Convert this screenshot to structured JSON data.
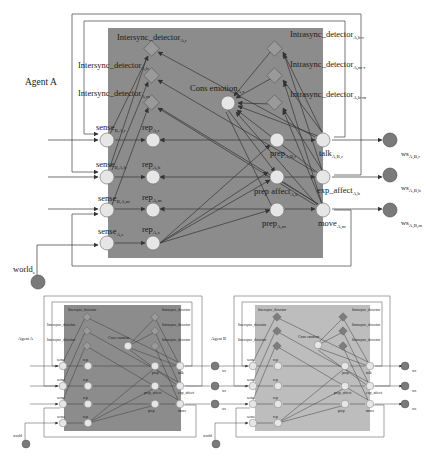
{
  "colors": {
    "background": "#ffffff",
    "agent_a_box": "#8c8c8c",
    "agent_b_box": "#bdbdbd",
    "state_node_fill": "#e6e6e6",
    "world_node_fill": "#7a7a7a",
    "detector_fill": "#9a9a9a",
    "detector_fill_b": "#7d7d7d",
    "edge": "#3a3a3a",
    "loop": "#555555"
  },
  "main_diagram": {
    "agent_label": "Agent A",
    "detectors_left": [
      {
        "base": "Intersync_detector",
        "sub": "A,r"
      },
      {
        "base": "Intersync_detector",
        "sub": "A,b"
      },
      {
        "base": "Intersync_detector",
        "sub": "A,m"
      }
    ],
    "detectors_right": [
      {
        "base": "Intrasync_detector",
        "sub": "A,b-r"
      },
      {
        "base": "Intrasync_detector",
        "sub": "A,m-r"
      },
      {
        "base": "Intrasync_detector",
        "sub": "A,b-m"
      }
    ],
    "cons_emotion": {
      "base": "Cons emotion",
      "sub": "A,s"
    },
    "sense_nodes": [
      {
        "base": "sense",
        "sub": "B,A,r"
      },
      {
        "base": "sense",
        "sub": "B,A,b"
      },
      {
        "base": "sense",
        "sub": "B,A,m"
      },
      {
        "base": "sense",
        "sub": "A,s"
      }
    ],
    "rep_nodes": [
      {
        "base": "rep",
        "sub": "A,r"
      },
      {
        "base": "rep",
        "sub": "A,b"
      },
      {
        "base": "rep",
        "sub": "A,m"
      },
      {
        "base": "rep",
        "sub": "A,s"
      }
    ],
    "prep_nodes": [
      {
        "base": "prep",
        "sub": "A,B,r"
      },
      {
        "base": "prep affect",
        "sub": "A,b"
      },
      {
        "base": "prep",
        "sub": "A,m"
      }
    ],
    "effector_nodes": [
      {
        "base": "talk",
        "sub": "A,B,r"
      },
      {
        "base": "exp_affect",
        "sub": "A,b"
      },
      {
        "base": "move",
        "sub": "A,m"
      }
    ],
    "world_state_nodes": [
      {
        "base": "ws",
        "sub": "A,B,r"
      },
      {
        "base": "ws",
        "sub": "A,B,b"
      },
      {
        "base": "ws",
        "sub": "A,B,m"
      }
    ],
    "world_node": {
      "base": "world",
      "sub": "s"
    }
  },
  "bottom_diagrams": [
    {
      "agent_label": "Agent A",
      "detectors_left": [
        "Intersync_detector",
        "Intersync_detector",
        "Intersync_detector"
      ],
      "detectors_right": [
        "Intrasync_detector",
        "Intrasync_detector",
        "Intrasync_detector"
      ],
      "cons_emotion": "Cons emotion",
      "sense": [
        "sense",
        "sense",
        "sense",
        "sense"
      ],
      "rep": [
        "rep",
        "rep",
        "rep",
        "rep"
      ],
      "prep": [
        "prep",
        "prep_affect",
        "prep"
      ],
      "effectors": [
        "talk",
        "exp_affect",
        "move"
      ],
      "ws": [
        "ws",
        "ws",
        "ws"
      ],
      "world": "world"
    },
    {
      "agent_label": "Agent B",
      "detectors_left": [
        "Intersync_detector",
        "Intersync_detector",
        "Intersync_detector"
      ],
      "detectors_right": [
        "Intrasync_detector",
        "Intrasync_detector",
        "Intrasync_detector"
      ],
      "cons_emotion": "Cons emotion",
      "sense": [
        "sense",
        "sense",
        "sense",
        "sense"
      ],
      "rep": [
        "rep",
        "rep",
        "rep",
        "rep"
      ],
      "prep": [
        "prep",
        "prep_affect",
        "prep"
      ],
      "effectors": [
        "talk",
        "exp_affect",
        "move"
      ],
      "ws": [
        "ws",
        "ws",
        "ws"
      ],
      "world": "world"
    }
  ]
}
